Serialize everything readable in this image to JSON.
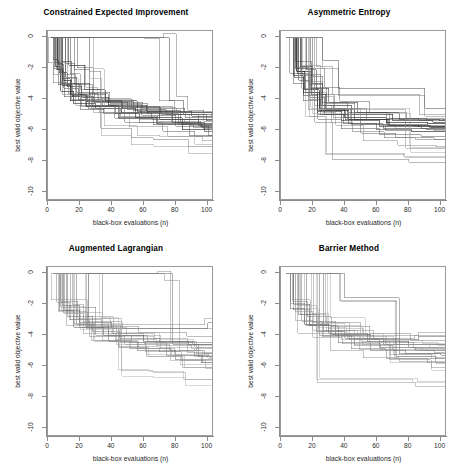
{
  "figure": {
    "layout": "2x2 grid of line charts",
    "width": 465,
    "height": 472,
    "background": "#ffffff"
  },
  "axes": {
    "xlabel": "black-box evaluations (n)",
    "ylabel": "best valid objective value",
    "xticks": [
      "0",
      "20",
      "40",
      "60",
      "80",
      "100"
    ],
    "yticks": [
      "0",
      "-2",
      "-4",
      "-6",
      "-8",
      "-10"
    ],
    "xlim": [
      0,
      104
    ],
    "ylim": [
      -10.6,
      0.4
    ],
    "grid": false,
    "box_color": "#9a9a9a"
  },
  "panels": [
    {
      "id": "constrained-expected-improvement",
      "title": "Constrained Expected Improvement"
    },
    {
      "id": "asymmetric-entropy",
      "title": "Asymmetric Entropy"
    },
    {
      "id": "augmented-lagrangian",
      "title": "Augmented Lagrangian"
    },
    {
      "id": "barrier-method",
      "title": "Barrier Method"
    }
  ],
  "chart_data": [
    {
      "type": "line",
      "title": "Constrained Expected Improvement",
      "xlabel": "black-box evaluations (n)",
      "ylabel": "best valid objective value",
      "xlim": [
        0,
        104
      ],
      "ylim": [
        -10.6,
        0.4
      ],
      "xticks": [
        0,
        20,
        40,
        60,
        80,
        100
      ],
      "yticks": [
        0,
        -2,
        -4,
        -6,
        -8,
        -10
      ],
      "grid": false,
      "legend": "none",
      "line_style": "step",
      "note": "30 monotone non-increasing step traces (one per random restart) of best valid objective value vs number of black-box evaluations; line shades range black to light gray",
      "series": [
        {
          "name": "run-01",
          "color": "#111111",
          "x": [
            2,
            6,
            9,
            14,
            24,
            46,
            70,
            104
          ],
          "values": [
            -0.05,
            -2.1,
            -3.1,
            -4.1,
            -4.5,
            -4.9,
            -5.3,
            -5.3
          ]
        },
        {
          "name": "run-02",
          "color": "#222222",
          "x": [
            2,
            5,
            8,
            16,
            30,
            55,
            84,
            104
          ],
          "values": [
            -0.05,
            -1.9,
            -3.5,
            -4.3,
            -4.6,
            -5.2,
            -6.0,
            -6.0
          ]
        },
        {
          "name": "run-03",
          "color": "#333333",
          "x": [
            2,
            7,
            12,
            21,
            38,
            62,
            90,
            104
          ],
          "values": [
            -0.05,
            -2.3,
            -3.2,
            -3.9,
            -4.4,
            -4.8,
            -5.1,
            -5.1
          ]
        },
        {
          "name": "run-04",
          "color": "#444444",
          "x": [
            2,
            9,
            15,
            26,
            44,
            68,
            96,
            104
          ],
          "values": [
            -0.05,
            -1.6,
            -3.0,
            -4.4,
            -5.2,
            -5.6,
            -5.8,
            -5.8
          ]
        },
        {
          "name": "run-05",
          "color": "#555555",
          "x": [
            2,
            11,
            18,
            29,
            50,
            74,
            99,
            104
          ],
          "values": [
            -0.05,
            -2.6,
            -3.6,
            -4.2,
            -4.7,
            -5.0,
            -5.4,
            -5.4
          ]
        },
        {
          "name": "run-06",
          "color": "#666666",
          "x": [
            2,
            4,
            10,
            19,
            34,
            58,
            86,
            104
          ],
          "values": [
            -0.05,
            -2.0,
            -3.3,
            -4.0,
            -4.5,
            -4.9,
            -5.2,
            -5.2
          ]
        },
        {
          "name": "run-07",
          "color": "#777777",
          "x": [
            2,
            8,
            17,
            27,
            48,
            72,
            92,
            104
          ],
          "values": [
            -0.05,
            -2.4,
            -3.8,
            -4.6,
            -5.5,
            -6.1,
            -6.4,
            -6.4
          ]
        },
        {
          "name": "run-08",
          "color": "#3a3a3a",
          "x": [
            2,
            13,
            23,
            36,
            56,
            78,
            98,
            104
          ],
          "values": [
            -0.05,
            -1.8,
            -3.4,
            -4.1,
            -4.8,
            -5.5,
            -6.1,
            -6.1
          ]
        },
        {
          "name": "run-09",
          "color": "#888888",
          "x": [
            2,
            26,
            33,
            52,
            66,
            88,
            100,
            104
          ],
          "values": [
            -0.05,
            -2.2,
            -5.9,
            -6.5,
            -6.6,
            -7.1,
            -7.1,
            -7.1
          ]
        },
        {
          "name": "run-10",
          "color": "#5c5c5c",
          "x": [
            2,
            68,
            76,
            85,
            94,
            104
          ],
          "values": [
            -0.05,
            -0.05,
            -4.1,
            -5.0,
            -5.7,
            -5.7
          ]
        }
      ]
    },
    {
      "type": "line",
      "title": "Asymmetric Entropy",
      "xlabel": "black-box evaluations (n)",
      "ylabel": "best valid objective value",
      "xlim": [
        0,
        104
      ],
      "ylim": [
        -10.6,
        0.4
      ],
      "xticks": [
        0,
        20,
        40,
        60,
        80,
        100
      ],
      "yticks": [
        0,
        -2,
        -4,
        -6,
        -8,
        -10
      ],
      "grid": false,
      "legend": "none",
      "line_style": "step",
      "note": "30 monotone step traces; most converge between -4.5 and -6.5, a few outliers near -8",
      "series": [
        {
          "name": "run-01",
          "color": "#111111",
          "x": [
            3,
            10,
            15,
            24,
            40,
            66,
            92,
            104
          ],
          "values": [
            -0.05,
            -2.2,
            -3.4,
            -4.6,
            -5.2,
            -5.5,
            -5.6,
            -5.6
          ]
        },
        {
          "name": "run-02",
          "color": "#222222",
          "x": [
            3,
            12,
            20,
            26,
            44,
            70,
            95,
            104
          ],
          "values": [
            -0.05,
            -1.9,
            -3.0,
            -4.4,
            -5.0,
            -5.4,
            -5.5,
            -5.5
          ]
        },
        {
          "name": "run-03",
          "color": "#333333",
          "x": [
            3,
            8,
            14,
            23,
            38,
            62,
            88,
            104
          ],
          "values": [
            -0.05,
            -2.5,
            -3.6,
            -4.8,
            -5.4,
            -5.8,
            -5.9,
            -5.9
          ]
        },
        {
          "name": "run-04",
          "color": "#444444",
          "x": [
            3,
            16,
            22,
            30,
            48,
            74,
            99,
            104
          ],
          "values": [
            -0.05,
            -2.1,
            -3.3,
            -4.2,
            -4.9,
            -5.3,
            -5.4,
            -5.4
          ]
        },
        {
          "name": "run-05",
          "color": "#555555",
          "x": [
            3,
            11,
            18,
            27,
            42,
            60,
            82,
            104
          ],
          "values": [
            -0.05,
            -2.8,
            -3.9,
            -5.0,
            -5.6,
            -6.0,
            -6.1,
            -6.1
          ]
        },
        {
          "name": "run-06",
          "color": "#666666",
          "x": [
            3,
            26,
            36,
            55,
            78,
            90,
            104
          ],
          "values": [
            -0.05,
            -1.5,
            -3.3,
            -3.3,
            -3.3,
            -4.6,
            -4.6
          ]
        },
        {
          "name": "run-07",
          "color": "#777777",
          "x": [
            3,
            13,
            25,
            33,
            50,
            72,
            96,
            104
          ],
          "values": [
            -0.05,
            -2.4,
            -4.4,
            -5.2,
            -6.2,
            -6.5,
            -6.6,
            -6.6
          ]
        },
        {
          "name": "run-08",
          "color": "#3a3a3a",
          "x": [
            3,
            9,
            19,
            28,
            46,
            68,
            86,
            104
          ],
          "values": [
            -0.05,
            -2.0,
            -3.7,
            -4.7,
            -5.3,
            -5.7,
            -5.8,
            -5.8
          ]
        },
        {
          "name": "run-09",
          "color": "#999999",
          "x": [
            3,
            17,
            31,
            58,
            78,
            104
          ],
          "values": [
            -0.05,
            -4.7,
            -4.7,
            -4.7,
            -7.2,
            -7.2
          ]
        },
        {
          "name": "run-10",
          "color": "#8a8a8a",
          "x": [
            3,
            21,
            32,
            56,
            80,
            104
          ],
          "values": [
            -0.05,
            -5.5,
            -7.9,
            -7.9,
            -8.1,
            -8.1
          ]
        }
      ]
    },
    {
      "type": "line",
      "title": "Augmented Lagrangian",
      "xlabel": "black-box evaluations (n)",
      "ylabel": "best valid objective value",
      "xlim": [
        0,
        104
      ],
      "ylim": [
        -10.6,
        0.4
      ],
      "xticks": [
        0,
        20,
        40,
        60,
        80,
        100
      ],
      "yticks": [
        0,
        -2,
        -4,
        -6,
        -8,
        -10
      ],
      "grid": false,
      "legend": "none",
      "line_style": "step",
      "note": "lighter gray traces; converge broadly between -3 and -7",
      "series": [
        {
          "name": "run-01",
          "color": "#6a6a6a",
          "x": [
            3,
            9,
            20,
            40,
            72,
            100,
            104
          ],
          "values": [
            -0.05,
            -2.1,
            -3.2,
            -3.6,
            -3.6,
            -3.2,
            -3.2
          ]
        },
        {
          "name": "run-02",
          "color": "#777777",
          "x": [
            3,
            12,
            28,
            45,
            70,
            92,
            104
          ],
          "values": [
            -0.05,
            -2.8,
            -3.8,
            -4.2,
            -4.5,
            -4.8,
            -4.8
          ]
        },
        {
          "name": "run-03",
          "color": "#5a5a5a",
          "x": [
            3,
            7,
            16,
            35,
            60,
            88,
            104
          ],
          "values": [
            -0.05,
            -2.4,
            -3.5,
            -4.0,
            -4.4,
            -4.6,
            -4.6
          ]
        },
        {
          "name": "run-04",
          "color": "#888888",
          "x": [
            3,
            14,
            26,
            48,
            76,
            98,
            104
          ],
          "values": [
            -0.05,
            -3.0,
            -4.1,
            -4.6,
            -5.0,
            -5.2,
            -5.2
          ]
        },
        {
          "name": "run-05",
          "color": "#999999",
          "x": [
            3,
            10,
            22,
            42,
            68,
            90,
            104
          ],
          "values": [
            -0.05,
            -2.6,
            -3.9,
            -4.3,
            -4.7,
            -4.9,
            -4.9
          ]
        },
        {
          "name": "run-06",
          "color": "#6f6f6f",
          "x": [
            3,
            18,
            38,
            56,
            80,
            104
          ],
          "values": [
            -0.05,
            -3.3,
            -4.4,
            -5.0,
            -5.6,
            -5.6
          ]
        },
        {
          "name": "run-07",
          "color": "#808080",
          "x": [
            3,
            8,
            30,
            52,
            74,
            96,
            104
          ],
          "values": [
            -0.05,
            -2.2,
            -4.0,
            -4.5,
            -5.3,
            -5.8,
            -5.8
          ]
        },
        {
          "name": "run-08",
          "color": "#a0a0a0",
          "x": [
            3,
            34,
            46,
            66,
            86,
            104
          ],
          "values": [
            -0.05,
            -2.9,
            -6.3,
            -6.4,
            -6.9,
            -6.9
          ]
        },
        {
          "name": "run-09",
          "color": "#707070",
          "x": [
            3,
            70,
            78,
            94,
            104
          ],
          "values": [
            -0.05,
            -0.05,
            -4.6,
            -5.4,
            -5.4
          ]
        },
        {
          "name": "run-10",
          "color": "#949494",
          "x": [
            3,
            24,
            44,
            62,
            84,
            104
          ],
          "values": [
            -0.05,
            -3.6,
            -4.8,
            -5.4,
            -6.1,
            -6.1
          ]
        }
      ]
    },
    {
      "type": "line",
      "title": "Barrier Method",
      "xlabel": "black-box evaluations (n)",
      "ylabel": "best valid objective value",
      "xlim": [
        0,
        104
      ],
      "ylim": [
        -10.6,
        0.4
      ],
      "xticks": [
        0,
        20,
        40,
        60,
        80,
        100
      ],
      "yticks": [
        0,
        -2,
        -4,
        -6,
        -8,
        -10
      ],
      "grid": false,
      "legend": "none",
      "line_style": "step",
      "note": "lighter gray traces; tight band between -4 and -6 by n=100",
      "series": [
        {
          "name": "run-01",
          "color": "#6a6a6a",
          "x": [
            3,
            8,
            18,
            34,
            58,
            86,
            104
          ],
          "values": [
            -0.05,
            -2.0,
            -3.4,
            -4.0,
            -4.3,
            -4.1,
            -4.1
          ]
        },
        {
          "name": "run-02",
          "color": "#777777",
          "x": [
            3,
            11,
            22,
            40,
            64,
            90,
            104
          ],
          "values": [
            -0.05,
            -2.7,
            -3.8,
            -4.2,
            -4.6,
            -4.6,
            -4.6
          ]
        },
        {
          "name": "run-03",
          "color": "#5a5a5a",
          "x": [
            3,
            6,
            15,
            30,
            54,
            80,
            104
          ],
          "values": [
            -0.05,
            -2.3,
            -3.3,
            -3.9,
            -4.4,
            -4.8,
            -4.8
          ]
        },
        {
          "name": "run-04",
          "color": "#888888",
          "x": [
            3,
            13,
            26,
            46,
            70,
            96,
            104
          ],
          "values": [
            -0.05,
            -3.1,
            -4.1,
            -4.7,
            -5.0,
            -5.1,
            -5.1
          ]
        },
        {
          "name": "run-05",
          "color": "#999999",
          "x": [
            3,
            9,
            20,
            38,
            62,
            88,
            104
          ],
          "values": [
            -0.05,
            -2.5,
            -3.7,
            -4.3,
            -4.8,
            -5.0,
            -5.0
          ]
        },
        {
          "name": "run-06",
          "color": "#6f6f6f",
          "x": [
            3,
            16,
            36,
            56,
            78,
            104
          ],
          "values": [
            -0.05,
            -3.4,
            -4.5,
            -5.0,
            -5.2,
            -5.2
          ]
        },
        {
          "name": "run-07",
          "color": "#808080",
          "x": [
            3,
            24,
            44,
            66,
            92,
            104
          ],
          "values": [
            -0.05,
            -4.0,
            -4.9,
            -5.5,
            -5.8,
            -5.8
          ]
        },
        {
          "name": "run-08",
          "color": "#a0a0a0",
          "x": [
            3,
            23,
            42,
            60,
            84,
            104
          ],
          "values": [
            -0.05,
            -7.1,
            -7.1,
            -7.1,
            -7.3,
            -7.3
          ]
        },
        {
          "name": "run-09",
          "color": "#707070",
          "x": [
            3,
            40,
            57,
            74,
            100,
            104
          ],
          "values": [
            -0.05,
            -1.6,
            -1.6,
            -5.2,
            -5.3,
            -5.3
          ]
        },
        {
          "name": "run-10",
          "color": "#949494",
          "x": [
            3,
            28,
            50,
            68,
            94,
            104
          ],
          "values": [
            -0.05,
            -3.2,
            -4.4,
            -5.6,
            -6.1,
            -6.1
          ]
        }
      ]
    }
  ]
}
